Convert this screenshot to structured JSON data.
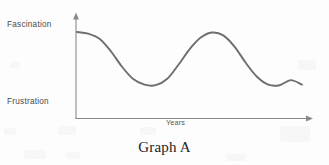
{
  "figure": {
    "caption": "Graph A",
    "line_color": "#6e6e6e",
    "axis_color": "#8a8a8a",
    "background_color": "#fdfdfd"
  },
  "chart_data": {
    "type": "line",
    "title": "Graph A",
    "xlabel": "Years",
    "ylabel": "",
    "grid": false,
    "legend": "none",
    "y_axis_tick_labels": [
      "Fascination",
      "Frustration"
    ],
    "y_axis_top_label": "Fascination",
    "y_axis_bottom_label": "Frustration",
    "x_axis_label": "Years",
    "xlim": [
      0,
      10
    ],
    "ylim": [
      0,
      1
    ],
    "annotations": [],
    "series": [
      {
        "name": "enthusiasm over time",
        "description": "Damped-free oscillating curve: starts at Fascination, drops to Frustration, then repeats for about three cycles, ending mid-descent near Frustration.",
        "x": [
          0.0,
          0.5,
          1.0,
          1.5,
          2.0,
          2.5,
          3.0,
          3.5,
          4.0,
          4.5,
          5.0,
          5.5,
          6.0,
          6.5,
          7.0,
          7.5,
          8.0,
          8.5,
          9.0,
          9.5,
          10.0
        ],
        "y": [
          1.0,
          0.97,
          0.88,
          0.66,
          0.38,
          0.16,
          0.06,
          0.05,
          0.16,
          0.41,
          0.69,
          0.9,
          0.99,
          0.94,
          0.74,
          0.45,
          0.2,
          0.06,
          0.05,
          0.14,
          0.06
        ]
      }
    ],
    "key_points": {
      "start": {
        "x": 0.0,
        "y": 1.0,
        "label": "Fascination"
      },
      "troughs": [
        {
          "x": 1.85,
          "y": 0.05
        },
        {
          "x": 5.35,
          "y": 0.05
        }
      ],
      "peaks": [
        {
          "x": 0.0,
          "y": 1.0
        },
        {
          "x": 3.65,
          "y": 1.0
        },
        {
          "x": 7.9,
          "y": 1.0
        }
      ],
      "end": {
        "x": 10.0,
        "y": 0.06,
        "label": "Frustration"
      }
    }
  }
}
